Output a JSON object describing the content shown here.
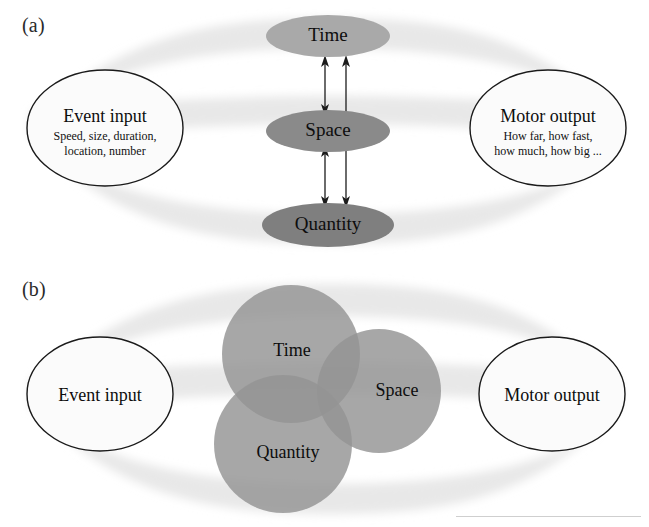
{
  "figure": {
    "panels": [
      {
        "id": "a",
        "label": "(a)",
        "nodes": [
          {
            "name": "time",
            "label": "Time"
          },
          {
            "name": "space",
            "label": "Space"
          },
          {
            "name": "quantity",
            "label": "Quantity"
          }
        ],
        "input": {
          "title": "Event input",
          "sub_line1": "Speed, size, duration,",
          "sub_line2": "location, number"
        },
        "output": {
          "title": "Motor output",
          "sub_line1": "How far, how fast,",
          "sub_line2": "how much, how big ..."
        },
        "connections": [
          {
            "name": "time-space-arrow",
            "from": "Time",
            "to": "Space",
            "style": "double-headed"
          },
          {
            "name": "space-quantity-arrow",
            "from": "Space",
            "to": "Quantity",
            "style": "double-headed"
          },
          {
            "name": "time-quantity-arrow",
            "from": "Time",
            "to": "Quantity",
            "style": "double-headed"
          }
        ]
      },
      {
        "id": "b",
        "label": "(b)",
        "nodes": [
          {
            "name": "time",
            "label": "Time"
          },
          {
            "name": "space",
            "label": "Space"
          },
          {
            "name": "quantity",
            "label": "Quantity"
          }
        ],
        "input": {
          "title": "Event input"
        },
        "output": {
          "title": "Motor output"
        }
      }
    ],
    "colors": {
      "band": "#e8e8e8",
      "time_fill_a": "#a9a9a9",
      "space_fill_a": "#8a8a8a",
      "quantity_fill_a": "#7f7f7f",
      "circle_fill_b": "#9b9b9b",
      "outline": "#1a1a1a",
      "background": "#ffffff"
    }
  }
}
